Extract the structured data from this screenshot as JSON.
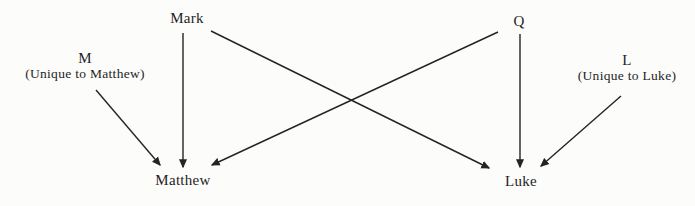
{
  "diagram": {
    "description_colors": {
      "ink": "#242424",
      "background": "#fcfcfb"
    },
    "nodes": {
      "mark": {
        "label": "Mark"
      },
      "q": {
        "label": "Q"
      },
      "m": {
        "label": "M",
        "sublabel": "(Unique to Matthew)"
      },
      "l": {
        "label": "L",
        "sublabel": "(Unique to Luke)"
      },
      "matthew": {
        "label": "Matthew"
      },
      "luke": {
        "label": "Luke"
      }
    },
    "edges": [
      {
        "from": "M",
        "to": "Matthew"
      },
      {
        "from": "Mark",
        "to": "Matthew"
      },
      {
        "from": "Mark",
        "to": "Luke"
      },
      {
        "from": "Q",
        "to": "Matthew"
      },
      {
        "from": "Q",
        "to": "Luke"
      },
      {
        "from": "L",
        "to": "Luke"
      }
    ]
  }
}
